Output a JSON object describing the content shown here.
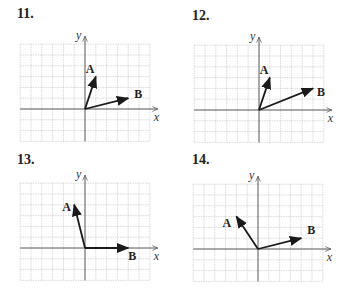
{
  "cell_px": 10.8,
  "grid": {
    "cols_left": 6,
    "cols_right": 6,
    "rows_up": 6,
    "rows_down": 3
  },
  "colors": {
    "grid": "#c8c8c8",
    "axis": "#555555",
    "vector": "#1a1a1a",
    "text": "#222222"
  },
  "axis_labels": {
    "x": "x",
    "y": "y"
  },
  "problems": [
    {
      "number": "11.",
      "origin": [
        85,
        109
      ],
      "vectors": [
        {
          "label": "A",
          "x": 1,
          "y": 3,
          "label_dx": -10,
          "label_dy": -4
        },
        {
          "label": "B",
          "x": 4,
          "y": 1,
          "label_dx": 6,
          "label_dy": 0
        }
      ]
    },
    {
      "number": "12.",
      "origin": [
        259,
        110
      ],
      "vectors": [
        {
          "label": "A",
          "x": 1,
          "y": 3,
          "label_dx": -10,
          "label_dy": -4
        },
        {
          "label": "B",
          "x": 5,
          "y": 2,
          "label_dx": 4,
          "label_dy": 8
        }
      ]
    },
    {
      "number": "13.",
      "origin": [
        85,
        248
      ],
      "vectors": [
        {
          "label": "A",
          "x": -1,
          "y": 4,
          "label_dx": -12,
          "label_dy": 6
        },
        {
          "label": "B",
          "x": 4,
          "y": 0,
          "label_dx": 0,
          "label_dy": 12
        }
      ]
    },
    {
      "number": "14.",
      "origin": [
        258,
        249
      ],
      "vectors": [
        {
          "label": "A",
          "x": -2,
          "y": 3,
          "label_dx": -14,
          "label_dy": 10
        },
        {
          "label": "B",
          "x": 4,
          "y": 1,
          "label_dx": 6,
          "label_dy": -4
        }
      ]
    }
  ]
}
